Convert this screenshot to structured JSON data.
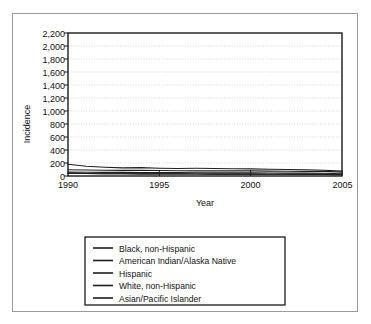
{
  "figure": {
    "border_color": "#9a9a9a",
    "background": "#ffffff"
  },
  "axes": {
    "ylabel": "Incidence",
    "xlabel": "Year",
    "y_ticks": [
      "0",
      "200",
      "400",
      "600",
      "800",
      "1,000",
      "1,200",
      "1,400",
      "1,600",
      "1,800",
      "2,000",
      "2,200"
    ],
    "x_ticks": [
      "1990",
      "1995",
      "2000",
      "2005"
    ]
  },
  "legend": {
    "items": [
      {
        "label": "Black, non-Hispanic"
      },
      {
        "label": "American Indian/Alaska Native"
      },
      {
        "label": "Hispanic"
      },
      {
        "label": "White, non-Hispanic"
      },
      {
        "label": "Asian/Pacific Islander"
      }
    ]
  },
  "chart_data": {
    "type": "line",
    "title": "",
    "xlabel": "Year",
    "ylabel": "Incidence",
    "xlim": [
      1990,
      2005
    ],
    "ylim": [
      0,
      2200
    ],
    "y_tick_step": 200,
    "grid": true,
    "legend_position": "below",
    "line_color": "#1f1f1f",
    "x": [
      1990,
      1991,
      1992,
      1993,
      1994,
      1995,
      1996,
      1997,
      1998,
      1999,
      2000,
      2001,
      2002,
      2003,
      2004,
      2005
    ],
    "series": [
      {
        "name": "Black, non-Hispanic",
        "values": [
          1870,
          1640,
          1380,
          1160,
          1120,
          1040,
          810,
          790,
          830,
          835,
          775,
          750,
          650,
          570,
          630,
          370
        ]
      },
      {
        "name": "American Indian/Alaska Native",
        "values": [
          180,
          150,
          135,
          125,
          130,
          120,
          115,
          118,
          115,
          112,
          110,
          105,
          100,
          95,
          90,
          75
        ]
      },
      {
        "name": "Hispanic",
        "values": [
          95,
          92,
          90,
          88,
          86,
          84,
          82,
          80,
          80,
          78,
          78,
          76,
          74,
          72,
          70,
          60
        ]
      },
      {
        "name": "White, non-Hispanic",
        "values": [
          60,
          58,
          56,
          55,
          54,
          52,
          52,
          50,
          50,
          48,
          48,
          46,
          45,
          44,
          42,
          35
        ]
      },
      {
        "name": "Asian/Pacific Islander",
        "values": [
          40,
          38,
          36,
          35,
          34,
          33,
          32,
          31,
          30,
          30,
          29,
          28,
          27,
          26,
          25,
          20
        ]
      }
    ]
  }
}
